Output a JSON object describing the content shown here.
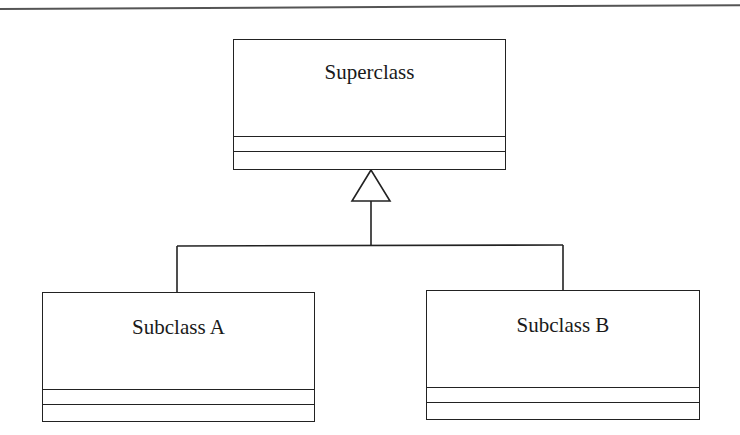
{
  "diagram": {
    "type": "UML class diagram (generalization / inheritance)",
    "classes": [
      {
        "id": "superclass",
        "name": "Superclass",
        "attributes": [],
        "operations": []
      },
      {
        "id": "subclass-a",
        "name": "Subclass A",
        "attributes": [],
        "operations": []
      },
      {
        "id": "subclass-b",
        "name": "Subclass B",
        "attributes": [],
        "operations": []
      }
    ],
    "relationships": [
      {
        "type": "generalization",
        "from": "subclass-a",
        "to": "superclass",
        "arrowhead": "hollow-triangle"
      },
      {
        "type": "generalization",
        "from": "subclass-b",
        "to": "superclass",
        "arrowhead": "hollow-triangle"
      }
    ],
    "colors": {
      "line": "#222222",
      "background": "#ffffff",
      "top_rule": "#555555"
    }
  }
}
